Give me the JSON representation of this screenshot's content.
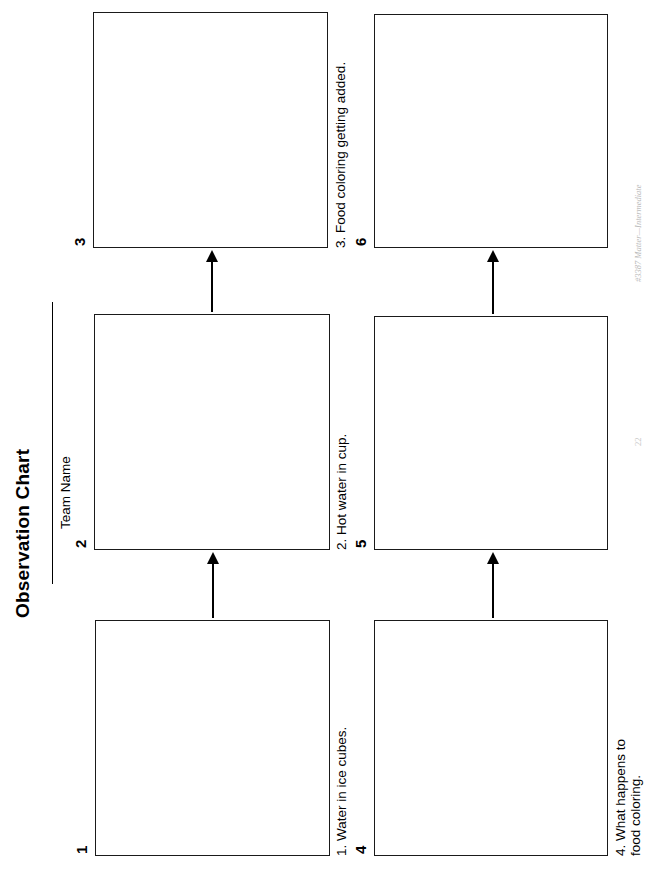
{
  "page": {
    "title": "Observation Chart",
    "team_name_label": "Team Name",
    "orientation": "landscape-rotated-90"
  },
  "boxes": [
    {
      "number": "1",
      "caption": "1. Water in ice cubes."
    },
    {
      "number": "2",
      "caption": "2. Hot water in cup."
    },
    {
      "number": "3",
      "caption": "3. Food coloring getting added."
    },
    {
      "number": "4",
      "caption": "4. What happens to\nfood coloring."
    },
    {
      "number": "5",
      "caption": ""
    },
    {
      "number": "6",
      "caption": ""
    }
  ],
  "arrows": [
    {
      "from": "1",
      "to": "2"
    },
    {
      "from": "2",
      "to": "3"
    },
    {
      "from": "4",
      "to": "5"
    },
    {
      "from": "5",
      "to": "6"
    }
  ],
  "footer": {
    "credit": "#3387 Matter—Intermediate",
    "page_number": "22"
  },
  "colors": {
    "ink": "#000000",
    "box_border": "#1a1a1a",
    "paper": "#ffffff",
    "footer_text": "#bcbcbc"
  }
}
